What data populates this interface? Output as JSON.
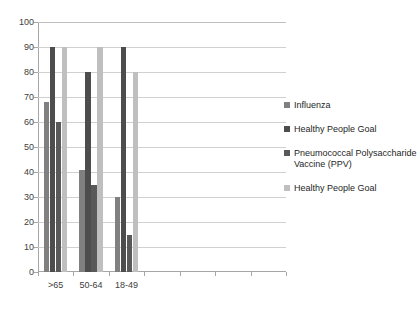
{
  "chart_data": {
    "type": "bar",
    "title": "",
    "subtitle": "",
    "xlabel": "",
    "ylabel": "",
    "ylim": [
      0,
      100
    ],
    "ytick_step": 10,
    "yticks": [
      "100",
      "90",
      "80",
      "70",
      "60",
      "50",
      "40",
      "30",
      "20",
      "10",
      "0"
    ],
    "grid": true,
    "legend_position": "right",
    "categories": [
      ">65",
      "50-64",
      "18-49"
    ],
    "empty_category_slots": 4,
    "series": [
      {
        "name": "Influenza",
        "color": "#808080",
        "values": [
          68,
          41,
          30
        ]
      },
      {
        "name": "Healthy People Goal",
        "color": "#4d4d4d",
        "values": [
          90,
          80,
          90
        ]
      },
      {
        "name": "Pneumococcal Polysaccharide Vaccine (PPV)",
        "color": "#595959",
        "values": [
          60,
          35,
          15
        ]
      },
      {
        "name": "Healthy People Goal",
        "color": "#bfbfbf",
        "values": [
          90,
          90,
          80
        ]
      }
    ]
  },
  "legend": {
    "entries": [
      {
        "label": "Influenza",
        "color": "#808080"
      },
      {
        "label": "Healthy People Goal",
        "color": "#4d4d4d"
      },
      {
        "label": "Pneumococcal Polysaccharide Vaccine (PPV)",
        "color": "#595959"
      },
      {
        "label": "Healthy People Goal",
        "color": "#bfbfbf"
      }
    ]
  }
}
